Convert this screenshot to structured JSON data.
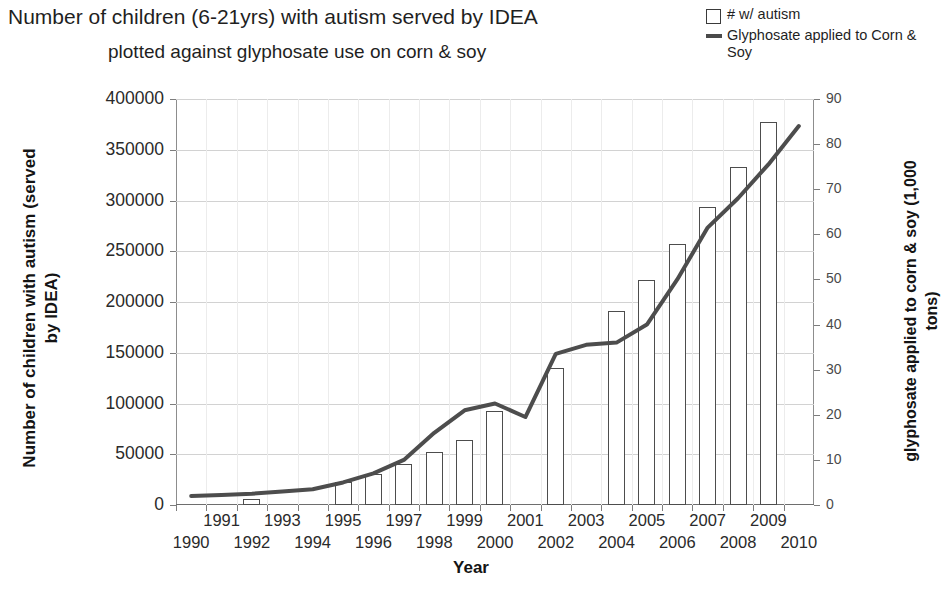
{
  "title": {
    "line1": "Number of children (6-21yrs) with autism served by IDEA",
    "line2": "plotted against glyphosate use on corn & soy"
  },
  "legend": {
    "items": [
      {
        "label": "# w/ autism",
        "marker": "open-square",
        "color": "#3a3a3a"
      },
      {
        "label": "Glyphosate applied to Corn & Soy",
        "marker": "line",
        "color": "#4a4a4a"
      }
    ]
  },
  "axes": {
    "x_title": "Year",
    "y_left_title": "Number of children with autism (served by IDEA)",
    "y_right_title": "glyphosate applied to corn & soy (1,000 tons)",
    "y_left_ticks": [
      "0",
      "50000",
      "100000",
      "150000",
      "200000",
      "250000",
      "300000",
      "350000",
      "400000"
    ],
    "y_right_ticks": [
      "0",
      "10",
      "20",
      "30",
      "40",
      "50",
      "60",
      "70",
      "80",
      "90"
    ],
    "x_ticks": [
      "1990",
      "1991",
      "1992",
      "1993",
      "1994",
      "1995",
      "1996",
      "1997",
      "1998",
      "1999",
      "2000",
      "2001",
      "2002",
      "2003",
      "2004",
      "2005",
      "2006",
      "2007",
      "2008",
      "2009",
      "2010"
    ]
  },
  "chart_data": {
    "type": "bar",
    "title": "Number of children (6-21yrs) with autism served by IDEA plotted against glyphosate use on corn & soy",
    "xlabel": "Year",
    "ylabel": "Number of children with autism (served by IDEA)",
    "y2label": "glyphosate applied to corn & soy (1,000 tons)",
    "ylim": [
      0,
      400000
    ],
    "y2lim": [
      0,
      90
    ],
    "grid": true,
    "legend_position": "top-right",
    "categories": [
      "1990",
      "1991",
      "1992",
      "1993",
      "1994",
      "1995",
      "1996",
      "1997",
      "1998",
      "1999",
      "2000",
      "2001",
      "2002",
      "2003",
      "2004",
      "2005",
      "2006",
      "2007",
      "2008",
      "2009",
      "2010"
    ],
    "series": [
      {
        "name": "# w/ autism",
        "type": "bar",
        "axis": "left",
        "values": [
          null,
          null,
          6000,
          null,
          null,
          23000,
          31000,
          40000,
          52000,
          64000,
          93000,
          null,
          135000,
          null,
          191000,
          222000,
          257000,
          294000,
          333000,
          377000,
          null
        ]
      },
      {
        "name": "Glyphosate applied to Corn & Soy",
        "type": "line",
        "axis": "right",
        "values": [
          2,
          2.2,
          2.5,
          3,
          3.5,
          5,
          7,
          10,
          16,
          21,
          22.5,
          19.5,
          33.5,
          35.5,
          36,
          40,
          50,
          61.5,
          68,
          75.5,
          84
        ]
      }
    ]
  }
}
